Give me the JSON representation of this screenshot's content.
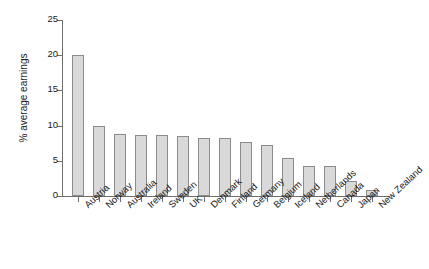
{
  "chart_data": {
    "type": "bar",
    "title": "",
    "subtitle": "",
    "xlabel": "",
    "ylabel": "% average earnings",
    "ylim": [
      0,
      25
    ],
    "yticks": [
      0,
      5,
      10,
      15,
      20,
      25
    ],
    "grid": false,
    "legend": false,
    "orientation": "vertical",
    "bar_color": "#d9d9d9",
    "bar_edge_color": "#8c8c8c",
    "axis_color": "#6e6e6e",
    "text_color": "#1a1a1a",
    "xtick_label_rotation": -43,
    "categories": [
      "Austria",
      "Norway",
      "Australia",
      "Ireland",
      "Sweden",
      "UK",
      "Denmark",
      "Finland",
      "Germany",
      "Belgium",
      "Iceland",
      "Netherlands",
      "Canada",
      "Japan",
      "New Zealand"
    ],
    "values": [
      20.1,
      9.9,
      8.8,
      8.7,
      8.6,
      8.5,
      8.3,
      8.2,
      7.7,
      7.3,
      5.4,
      4.3,
      4.2,
      2.2,
      0.8
    ]
  }
}
